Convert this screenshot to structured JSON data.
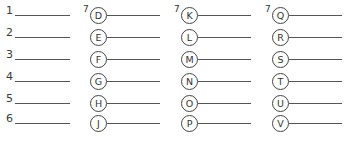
{
  "numbered_blanks": [
    "1",
    "2",
    "3",
    "4",
    "5",
    "6"
  ],
  "column_marker": "7",
  "columns": [
    {
      "letters": [
        "D",
        "E",
        "F",
        "G",
        "H",
        "J"
      ]
    },
    {
      "letters": [
        "K",
        "L",
        "M",
        "N",
        "O",
        "P"
      ]
    },
    {
      "letters": [
        "Q",
        "R",
        "S",
        "T",
        "U",
        "V"
      ]
    }
  ]
}
